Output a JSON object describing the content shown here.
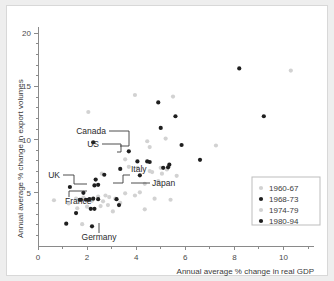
{
  "chart_data": {
    "type": "scatter",
    "title": "",
    "xlabel": "Annual average % change in real GDP",
    "ylabel": "Annual average % change in export volumes",
    "xlim": [
      0,
      11
    ],
    "ylim": [
      0,
      20.5
    ],
    "xticks": [
      0,
      2,
      4,
      6,
      8,
      10
    ],
    "xtick_labels": [
      "0",
      "2",
      "4",
      "6",
      "8",
      "10"
    ],
    "yticks": [
      5,
      10,
      15,
      20
    ],
    "ytick_labels": [
      "5",
      "10",
      "15",
      "20"
    ],
    "xminor_step": 1,
    "yminor_step": 1,
    "grid": false,
    "legend_position": "lower-right",
    "marker_light_color": "#d2d2d2",
    "marker_dark_color": "#1f1f1f",
    "series": [
      {
        "name": "1960-67",
        "color": "#d2d2d2",
        "marker": "circle",
        "points": [
          [
            0.65,
            4.3
          ],
          [
            1.25,
            4.0
          ],
          [
            1.6,
            3.55
          ],
          [
            1.85,
            4.55
          ],
          [
            2.05,
            12.6
          ],
          [
            2.45,
            4.65
          ],
          [
            2.6,
            6.8
          ],
          [
            2.75,
            4.75
          ],
          [
            2.85,
            3.85
          ],
          [
            3.15,
            4.45
          ],
          [
            3.55,
            8.15
          ],
          [
            3.7,
            7.45
          ],
          [
            3.95,
            14.2
          ],
          [
            4.05,
            7.35
          ],
          [
            4.35,
            5.85
          ],
          [
            4.45,
            9.85
          ],
          [
            4.55,
            9.3
          ],
          [
            4.65,
            6.95
          ],
          [
            4.9,
            6.1
          ],
          [
            5.05,
            6.8
          ],
          [
            5.2,
            10.1
          ],
          [
            5.5,
            14.05
          ],
          [
            5.65,
            6.6
          ],
          [
            7.25,
            9.45
          ],
          [
            10.3,
            16.5
          ]
        ]
      },
      {
        "name": "1968-73",
        "color": "#1f1f1f",
        "marker": "circle",
        "points": [
          [
            1.15,
            2.1
          ],
          [
            1.3,
            5.55
          ],
          [
            1.55,
            3.1
          ],
          [
            1.75,
            4.35
          ],
          [
            1.85,
            5.0
          ],
          [
            2.05,
            4.35
          ],
          [
            2.15,
            3.5
          ],
          [
            2.25,
            9.75
          ],
          [
            2.3,
            5.7
          ],
          [
            2.35,
            6.25
          ],
          [
            2.45,
            5.75
          ],
          [
            2.7,
            6.7
          ],
          [
            3.2,
            4.4
          ],
          [
            3.35,
            7.25
          ],
          [
            3.7,
            8.9
          ],
          [
            4.15,
            6.65
          ],
          [
            4.45,
            7.95
          ],
          [
            4.9,
            13.5
          ],
          [
            5.0,
            11.1
          ],
          [
            5.35,
            7.65
          ],
          [
            5.6,
            12.2
          ],
          [
            5.85,
            9.5
          ],
          [
            6.6,
            8.1
          ],
          [
            8.2,
            16.7
          ],
          [
            9.2,
            12.2
          ]
        ]
      },
      {
        "name": "1974-79",
        "color": "#d2d2d2",
        "marker": "circle",
        "points": [
          [
            1.55,
            4.45
          ],
          [
            1.8,
            2.05
          ],
          [
            2.0,
            3.7
          ],
          [
            2.2,
            4.25
          ],
          [
            2.55,
            3.75
          ],
          [
            2.65,
            4.2
          ],
          [
            2.9,
            4.6
          ],
          [
            3.05,
            3.25
          ],
          [
            3.35,
            4.05
          ],
          [
            3.55,
            4.95
          ],
          [
            3.95,
            4.75
          ],
          [
            4.15,
            5.05
          ],
          [
            4.35,
            3.45
          ],
          [
            4.55,
            7.05
          ],
          [
            4.75,
            4.45
          ],
          [
            5.0,
            7.35
          ],
          [
            5.25,
            7.2
          ],
          [
            5.4,
            4.35
          ]
        ]
      },
      {
        "name": "1980-94",
        "color": "#1f1f1f",
        "marker": "circle",
        "points": [
          [
            1.7,
            4.35
          ],
          [
            1.95,
            4.35
          ],
          [
            2.1,
            4.4
          ],
          [
            2.2,
            1.85
          ],
          [
            2.25,
            4.45
          ],
          [
            2.3,
            3.5
          ],
          [
            2.45,
            4.4
          ],
          [
            3.3,
            3.85
          ],
          [
            4.05,
            7.95
          ],
          [
            4.55,
            7.9
          ],
          [
            5.1,
            7.35
          ],
          [
            5.3,
            7.4
          ]
        ]
      }
    ],
    "annotations": [
      {
        "label": "Canada",
        "target": [
          2.35,
          6.25
        ]
      },
      {
        "label": "US",
        "target": [
          2.3,
          5.7
        ]
      },
      {
        "label": "UK",
        "target": [
          1.7,
          4.35
        ]
      },
      {
        "label": "Italy",
        "target": [
          2.75,
          4.75
        ]
      },
      {
        "label": "Japan",
        "target": [
          3.2,
          4.4
        ]
      },
      {
        "label": "France",
        "target": [
          1.95,
          3.5
        ]
      },
      {
        "label": "Germany",
        "target": [
          2.2,
          1.85
        ]
      }
    ]
  },
  "legend": {
    "items": [
      {
        "label": "1960-67",
        "color": "#d2d2d2"
      },
      {
        "label": "1968-73",
        "color": "#1f1f1f"
      },
      {
        "label": "1974-79",
        "color": "#d2d2d2"
      },
      {
        "label": "1980-94",
        "color": "#1f1f1f"
      }
    ]
  },
  "axes": {
    "x_title": "Annual average % change in real GDP",
    "y_title": "Annual average % change in export volumes"
  }
}
